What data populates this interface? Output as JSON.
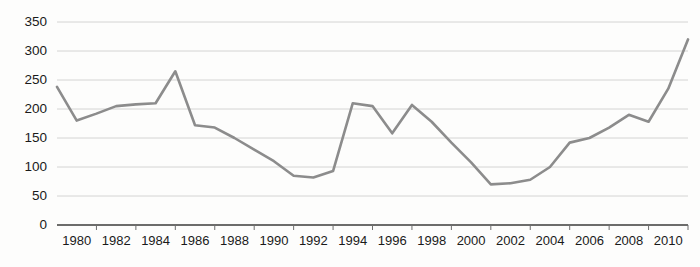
{
  "chart_data": {
    "type": "line",
    "title": "",
    "subtitle": "",
    "xlabel": "",
    "ylabel": "",
    "xlim": [
      1979,
      2011
    ],
    "ylim": [
      0,
      350
    ],
    "grid": true,
    "legend": false,
    "legend_position": "none",
    "line_color": "#8c8c8c",
    "grid_color": "#c9c9c9",
    "axis_color": "#3b3b3b",
    "background_color": "#fdfdfc",
    "yticks": [
      0,
      50,
      100,
      150,
      200,
      250,
      300,
      350
    ],
    "ytick_labels": [
      "0",
      "50",
      "100",
      "150",
      "200",
      "250",
      "300",
      "350"
    ],
    "xticks": [
      1980,
      1982,
      1984,
      1986,
      1988,
      1990,
      1992,
      1994,
      1996,
      1998,
      2000,
      2002,
      2004,
      2006,
      2008,
      2010
    ],
    "xtick_labels": [
      "1980",
      "1982",
      "1984",
      "1986",
      "1988",
      "1990",
      "1992",
      "1994",
      "1996",
      "1998",
      "2000",
      "2002",
      "2004",
      "2006",
      "2008",
      "2010"
    ],
    "x": [
      1979,
      1980,
      1981,
      1982,
      1983,
      1984,
      1985,
      1986,
      1987,
      1988,
      1989,
      1990,
      1991,
      1992,
      1993,
      1994,
      1995,
      1996,
      1997,
      1998,
      1999,
      2000,
      2001,
      2002,
      2003,
      2004,
      2005,
      2006,
      2007,
      2008,
      2009,
      2010,
      2011
    ],
    "values": [
      238,
      180,
      192,
      205,
      208,
      210,
      265,
      172,
      168,
      150,
      130,
      110,
      85,
      82,
      93,
      210,
      205,
      158,
      207,
      178,
      142,
      108,
      70,
      72,
      78,
      100,
      142,
      150,
      168,
      190,
      178,
      235,
      320
    ],
    "series": [
      {
        "name": "series-1",
        "color": "#8c8c8c",
        "values": [
          238,
          180,
          192,
          205,
          208,
          210,
          265,
          172,
          168,
          150,
          130,
          110,
          85,
          82,
          93,
          210,
          205,
          158,
          207,
          178,
          142,
          108,
          70,
          72,
          78,
          100,
          142,
          150,
          168,
          190,
          178,
          235,
          320
        ]
      }
    ],
    "annotations": []
  }
}
